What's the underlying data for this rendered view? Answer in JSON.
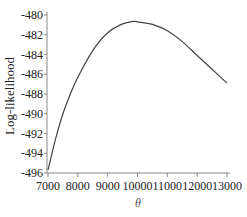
{
  "chart_data": {
    "type": "line",
    "title": "",
    "xlabel": "θ",
    "ylabel": "Log-likelihood",
    "xlim": [
      7000,
      13000
    ],
    "ylim": [
      -496,
      -480
    ],
    "xticks": [
      7000,
      8000,
      9000,
      10000,
      11000,
      12000,
      13000
    ],
    "yticks": [
      -480,
      -482,
      -484,
      -486,
      -488,
      -490,
      -492,
      -494,
      -496
    ],
    "grid": false,
    "legend": null,
    "series": [
      {
        "name": "Log-likelihood",
        "color": "#444444",
        "x": [
          7000,
          7250,
          7500,
          7750,
          8000,
          8500,
          9000,
          9500,
          9850,
          10000,
          10500,
          11000,
          11500,
          12000,
          12500,
          13000
        ],
        "y": [
          -495.7,
          -492.6,
          -490.0,
          -488.0,
          -486.3,
          -483.6,
          -481.8,
          -480.9,
          -480.65,
          -480.7,
          -480.95,
          -481.6,
          -482.7,
          -484.1,
          -485.5,
          -486.9
        ]
      }
    ]
  }
}
